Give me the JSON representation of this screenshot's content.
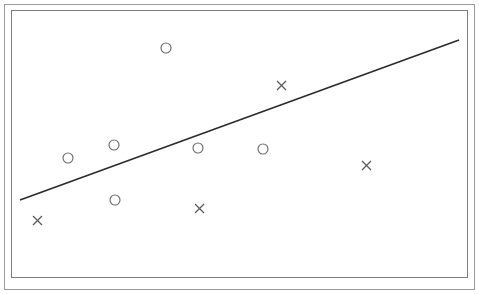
{
  "figure": {
    "title": "",
    "background_color": "#ffffff",
    "outer_frame_color": "#9a9a9a",
    "inner_frame_color": "#7d7d7d",
    "width_px": 479,
    "height_px": 294
  },
  "frames": {
    "outer": {
      "x": 4,
      "y": 4,
      "width": 471,
      "height": 286
    },
    "inner": {
      "x": 11,
      "y": 10,
      "width": 457,
      "height": 268
    }
  },
  "chart_data": {
    "type": "scatter",
    "title": "",
    "subtitle": "",
    "xlabel": "",
    "ylabel": "",
    "xlim": [
      0,
      100
    ],
    "ylim": [
      0,
      100
    ],
    "grid": false,
    "legend": false,
    "legend_position": "none",
    "axis_ticks": false,
    "tick_labels": {
      "x": [],
      "y": []
    },
    "annotations": [],
    "series": [
      {
        "name": "circle-group",
        "marker": "circle",
        "marker_color": "#6d6d6d",
        "marker_radius_px": 5,
        "points": [
          {
            "x": 12.5,
            "y": 31.6,
            "px": 68,
            "py": 158
          },
          {
            "x": 22.5,
            "y": 36.5,
            "px": 114,
            "py": 145
          },
          {
            "x": 22.8,
            "y": 16.0,
            "px": 115,
            "py": 200
          },
          {
            "x": 33.9,
            "y": 34.9,
            "px": 166,
            "py": 48
          },
          {
            "x": 40.9,
            "y": 35.0,
            "px": 198,
            "py": 148
          },
          {
            "x": 55.1,
            "y": 35.0,
            "px": 263,
            "py": 149
          }
        ]
      },
      {
        "name": "cross-group",
        "marker": "x",
        "marker_color": "#5a5a5a",
        "marker_size_px": 9,
        "points": [
          {
            "x": 5.7,
            "y": 8.5,
            "px": 37,
            "py": 220
          },
          {
            "x": 41.1,
            "y": 12.8,
            "px": 199,
            "py": 208
          },
          {
            "x": 59.1,
            "y": 69.1,
            "px": 281,
            "py": 85
          },
          {
            "x": 77.7,
            "y": 26.8,
            "px": 366,
            "py": 165
          }
        ]
      }
    ],
    "trendline": {
      "name": "regression-line",
      "color": "#2b2b2b",
      "width_px": 1.6,
      "start": {
        "px": 20,
        "py": 200
      },
      "end": {
        "px": 459,
        "py": 40
      },
      "slope_px_per_px": -0.3645,
      "description": "straight rising line from lower-left to upper-right"
    }
  }
}
